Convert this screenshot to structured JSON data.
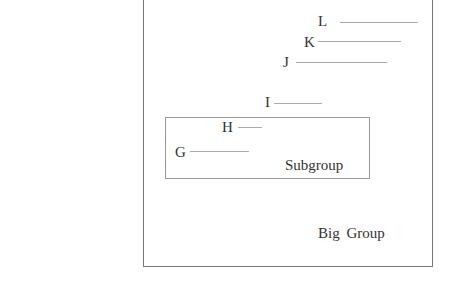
{
  "diagram": {
    "groups": [
      {
        "id": "big-group",
        "label": "Big Group"
      },
      {
        "id": "subgroup",
        "label": "Subgroup"
      }
    ],
    "items": [
      {
        "label": "L"
      },
      {
        "label": "K"
      },
      {
        "label": "J"
      },
      {
        "label": "I"
      },
      {
        "label": "H"
      },
      {
        "label": "G"
      }
    ]
  }
}
